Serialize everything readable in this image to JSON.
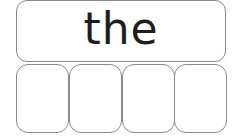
{
  "worksheet": {
    "sight_word": "the",
    "letter_boxes": [
      "",
      "",
      "",
      ""
    ]
  }
}
